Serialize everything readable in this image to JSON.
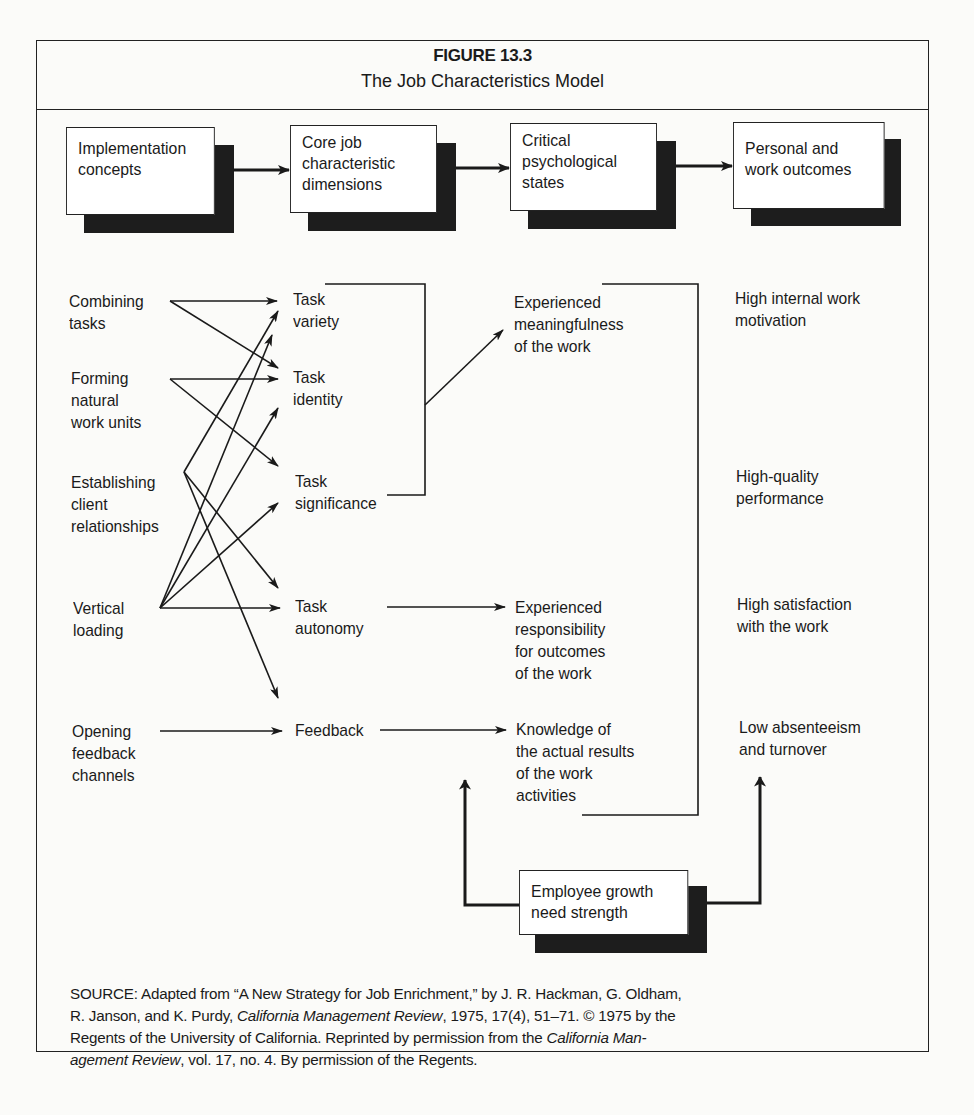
{
  "figure": {
    "number": "FIGURE 13.3",
    "title": "The Job Characteristics Model"
  },
  "header_boxes": [
    {
      "lines": [
        "Implementation",
        "concepts"
      ]
    },
    {
      "lines": [
        "Core job",
        "characteristic",
        "dimensions"
      ]
    },
    {
      "lines": [
        "Critical",
        "psychological",
        "states"
      ]
    },
    {
      "lines": [
        "Personal and",
        "work outcomes"
      ]
    }
  ],
  "implementation_concepts": [
    {
      "lines": [
        "Combining",
        "tasks"
      ]
    },
    {
      "lines": [
        "Forming",
        "natural",
        "work units"
      ]
    },
    {
      "lines": [
        "Establishing",
        "client",
        "relationships"
      ]
    },
    {
      "lines": [
        "Vertical",
        "loading"
      ]
    },
    {
      "lines": [
        "Opening",
        "feedback",
        "channels"
      ]
    }
  ],
  "core_dimensions": [
    {
      "lines": [
        "Task",
        "variety"
      ]
    },
    {
      "lines": [
        "Task",
        "identity"
      ]
    },
    {
      "lines": [
        "Task",
        "significance"
      ]
    },
    {
      "lines": [
        "Task",
        "autonomy"
      ]
    },
    {
      "lines": [
        "Feedback"
      ]
    }
  ],
  "psychological_states": [
    {
      "lines": [
        "Experienced",
        "meaningfulness",
        "of the work"
      ]
    },
    {
      "lines": [
        "Experienced",
        "responsibility",
        "for outcomes",
        "of the work"
      ]
    },
    {
      "lines": [
        "Knowledge of",
        "the actual results",
        "of the work",
        "activities"
      ]
    }
  ],
  "outcomes": [
    {
      "lines": [
        "High internal work",
        "motivation"
      ]
    },
    {
      "lines": [
        "High-quality",
        "performance"
      ]
    },
    {
      "lines": [
        "High satisfaction",
        "with the work"
      ]
    },
    {
      "lines": [
        "Low absenteeism",
        "and turnover"
      ]
    }
  ],
  "moderator": {
    "lines": [
      "Employee growth",
      "need strength"
    ]
  },
  "source": {
    "line1": "SOURCE:  Adapted from “A New Strategy for Job Enrichment,” by J. R. Hackman, G. Oldham,",
    "line2_a": "R. Janson, and K. Purdy, ",
    "line2_journal": "California Management Review",
    "line2_b": ", 1975, 17(4), 51–71. © 1975 by the",
    "line3_a": "Regents of the University of California. Reprinted by permission from the ",
    "line3_journal": "California Man-",
    "line4_journal": "agement Review",
    "line4_b": ", vol. 17, no. 4. By permission of the Regents."
  }
}
